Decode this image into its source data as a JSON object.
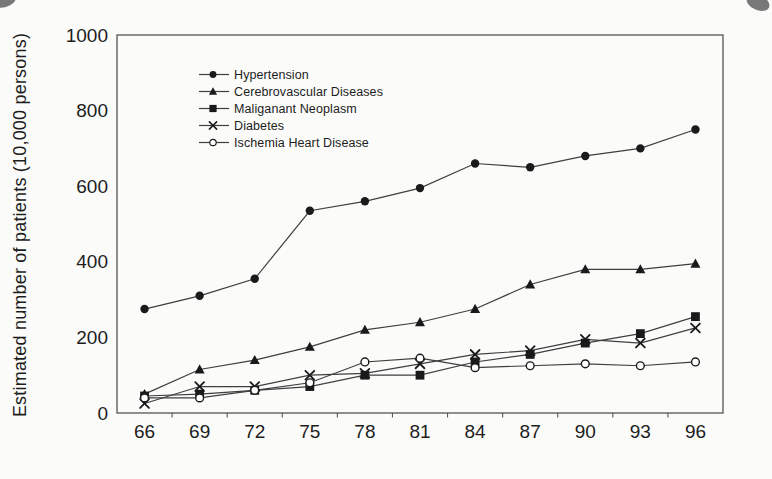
{
  "figure": {
    "background": "#fbfbfa",
    "ink_color": "#1a1a1a",
    "line_color": "#3f3f3f",
    "axis_color": "#555555"
  },
  "chart_data": {
    "type": "line",
    "title": "",
    "xlabel": "",
    "ylabel": "Estimated number of patients (10,000 persons)",
    "ylim": [
      0,
      1000
    ],
    "yticks": [
      0,
      200,
      400,
      600,
      800,
      1000
    ],
    "categories": [
      "66",
      "69",
      "72",
      "75",
      "78",
      "81",
      "84",
      "87",
      "90",
      "93",
      "96"
    ],
    "grid": false,
    "legend_position": "inside-top-left",
    "series": [
      {
        "name": "Hypertension",
        "marker": "filled-circle",
        "values": [
          275,
          310,
          355,
          535,
          560,
          595,
          660,
          650,
          680,
          700,
          750
        ]
      },
      {
        "name": "Cerebrovascular Diseases",
        "marker": "filled-triangle",
        "values": [
          50,
          115,
          140,
          175,
          220,
          240,
          275,
          340,
          380,
          380,
          395
        ]
      },
      {
        "name": "Maliganant Neoplasm",
        "marker": "filled-square",
        "values": [
          45,
          50,
          60,
          70,
          100,
          100,
          135,
          155,
          185,
          210,
          255
        ]
      },
      {
        "name": "Diabetes",
        "marker": "x-cross",
        "values": [
          25,
          70,
          70,
          100,
          105,
          130,
          155,
          165,
          195,
          185,
          225
        ]
      },
      {
        "name": "Ischemia Heart Disease",
        "marker": "open-circle",
        "values": [
          40,
          40,
          60,
          80,
          135,
          145,
          120,
          125,
          130,
          125,
          135
        ]
      }
    ]
  }
}
